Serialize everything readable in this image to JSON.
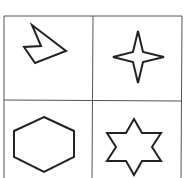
{
  "diagram": {
    "type": "shape-grid",
    "rows": 2,
    "cols": 2,
    "cells": [
      {
        "position": "top-left",
        "shape": "irregular-polygon"
      },
      {
        "position": "top-right",
        "shape": "four-point-star"
      },
      {
        "position": "bottom-left",
        "shape": "hexagon"
      },
      {
        "position": "bottom-right",
        "shape": "six-point-star"
      }
    ],
    "colors": {
      "stroke": "#222222",
      "grid": "#555555",
      "background": "#ffffff"
    }
  }
}
